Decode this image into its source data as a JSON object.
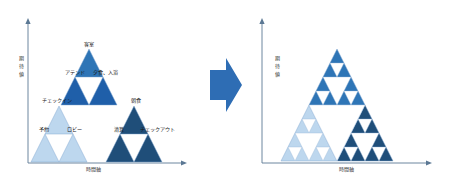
{
  "diagram": {
    "colors": {
      "light_blue": "#BDD7EE",
      "mid_blue": "#2E75B6",
      "strong_blue": "#1F5FA9",
      "dark_navy": "#1F4E79",
      "outline": "#7FA6CF",
      "axis": "#5B7894",
      "arrow": "#2E6DB4",
      "hole": "#FFFFFF"
    },
    "axes": {
      "y_label": "期待値",
      "y_label_chars": [
        "期",
        "待",
        "値"
      ],
      "x_label": "時間軸"
    },
    "left_panel": {
      "name": "labeled-service-triangle",
      "depth_label": "level-3",
      "nodes": [
        {
          "id": "n-apex",
          "label": "客室",
          "level": 1,
          "cx": 100,
          "label_x": 100,
          "label_y": 18.5
        },
        {
          "id": "n-attend",
          "label": "アテンド",
          "level": 2,
          "cx": 75,
          "label_x": 75.5,
          "label_y": 57.0
        },
        {
          "id": "n-dinner",
          "label": "夕食、入浴",
          "level": 2,
          "cx": 125,
          "label_x": 127.0,
          "label_y": 57.0
        },
        {
          "id": "n-checkin",
          "label": "チェックイン",
          "level": 3,
          "cx": 57,
          "label_x": 57.0,
          "label_y": 96.0
        },
        {
          "id": "n-breakfast",
          "label": "朝食",
          "level": 3,
          "cx": 138,
          "label_x": 139.0,
          "label_y": 96.0
        },
        {
          "id": "n-reserve",
          "label": "予約",
          "level": 4,
          "cx": 45,
          "label_x": 44.0,
          "label_y": 131.0
        },
        {
          "id": "n-lobby",
          "label": "ロビー",
          "level": 4,
          "cx": 73,
          "label_x": 74.0,
          "label_y": 131.0
        },
        {
          "id": "n-settle",
          "label": "清算",
          "level": 4,
          "cx": 120,
          "label_x": 120.0,
          "label_y": 131.0
        },
        {
          "id": "n-checkout",
          "label": "チェックアウト",
          "level": 4,
          "cx": 155,
          "label_x": 155.0,
          "label_y": 131.0
        }
      ]
    },
    "right_panel": {
      "name": "recursive-sierpinski-triangle",
      "depth_label": "level-4"
    },
    "connector": {
      "name": "transform-arrow",
      "direction": "right"
    }
  }
}
